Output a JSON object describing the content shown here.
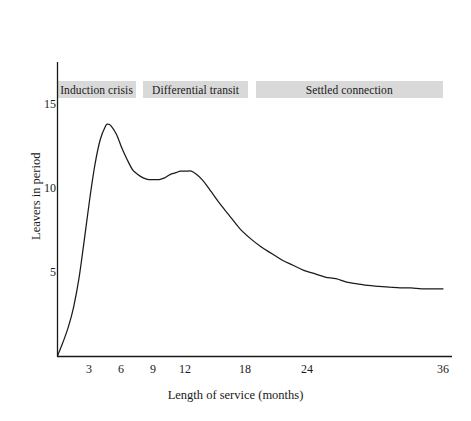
{
  "chart_data": {
    "type": "line",
    "title": "",
    "xlabel": "Length of service (months)",
    "ylabel": "Leavers in period",
    "xlim": [
      0,
      36
    ],
    "ylim": [
      0,
      16.5
    ],
    "grid": false,
    "legend": "none",
    "xticks": [
      3,
      6,
      9,
      12,
      18,
      24,
      36
    ],
    "xtick_labels": [
      "3",
      "6",
      "9",
      "12",
      "18",
      "24",
      "36"
    ],
    "yticks": [
      5,
      10,
      15
    ],
    "ytick_labels": [
      "5",
      "10",
      "15"
    ],
    "series": [
      {
        "name": "Leavers in period",
        "color": "#1a1a1a",
        "x": [
          0.0,
          0.5,
          1.0,
          1.5,
          2.0,
          2.5,
          3.0,
          3.5,
          4.0,
          4.5,
          4.7,
          5.0,
          5.5,
          6.0,
          6.5,
          7.0,
          7.5,
          8.0,
          8.5,
          9.0,
          9.5,
          10.0,
          10.5,
          11.0,
          11.5,
          12.0,
          12.5,
          13.0,
          13.5,
          14.0,
          15.0,
          16.0,
          17.0,
          18.0,
          19.0,
          20.0,
          21.0,
          22.0,
          23.0,
          24.0,
          25.0,
          26.0,
          27.0,
          28.0,
          29.0,
          30.0,
          31.0,
          32.0,
          33.0,
          34.0,
          35.0,
          36.0
        ],
        "y": [
          0.0,
          0.8,
          1.7,
          2.9,
          4.6,
          6.9,
          9.3,
          11.4,
          12.9,
          13.7,
          13.8,
          13.7,
          13.2,
          12.4,
          11.7,
          11.1,
          10.8,
          10.6,
          10.5,
          10.5,
          10.5,
          10.6,
          10.8,
          10.9,
          11.0,
          11.0,
          11.0,
          10.8,
          10.5,
          10.1,
          9.2,
          8.4,
          7.6,
          7.0,
          6.5,
          6.1,
          5.7,
          5.4,
          5.1,
          4.9,
          4.7,
          4.6,
          4.4,
          4.3,
          4.2,
          4.15,
          4.1,
          4.05,
          4.05,
          4.0,
          4.0,
          4.0
        ]
      }
    ],
    "phase_bands": [
      {
        "label": "Induction crisis",
        "x_start": 0.0,
        "x_end": 7.3
      },
      {
        "label": "Differential transit",
        "x_start": 8.0,
        "x_end": 17.8
      },
      {
        "label": "Settled connection",
        "x_start": 18.5,
        "x_end": 36.0
      }
    ],
    "band_color": "#d9d9d9"
  },
  "axes": {
    "axis_color": "#1a1a1a"
  }
}
